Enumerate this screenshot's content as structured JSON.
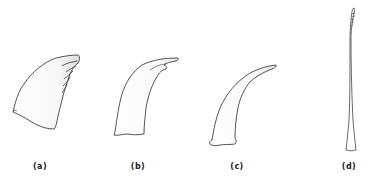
{
  "figure": {
    "panels": [
      {
        "id": "a",
        "label": "(a)",
        "shape": "broad-ridged-spine",
        "label_x": 40
      },
      {
        "id": "b",
        "label": "(b)",
        "shape": "curved-hooked-spine",
        "label_x": 138
      },
      {
        "id": "c",
        "label": "(c)",
        "shape": "curved-spine",
        "label_x": 237
      },
      {
        "id": "d",
        "label": "(d)",
        "shape": "slender-bristle",
        "label_x": 349
      }
    ],
    "stroke_color": "#2a2a2a",
    "shade_color": "#d8d8d8"
  }
}
